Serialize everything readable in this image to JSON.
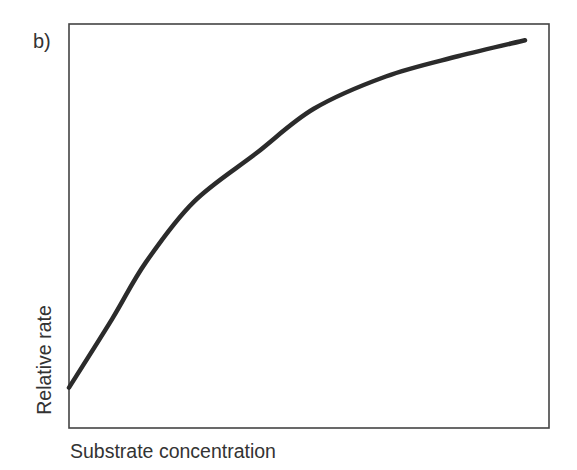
{
  "chart_data": {
    "type": "line",
    "panel_label": "b)",
    "title": "",
    "xlabel": "Substrate concentration",
    "ylabel": "Relative rate",
    "grid": false,
    "ticks": false,
    "legend": null,
    "xlim": [
      0,
      1
    ],
    "ylim": [
      0,
      1
    ],
    "series": [
      {
        "name": "rate curve",
        "description": "saturating (hyperbolic) increase of relative rate with substrate concentration",
        "x": [
          0.0,
          0.09,
          0.16,
          0.26,
          0.39,
          0.51,
          0.66,
          0.81,
          0.95
        ],
        "y": [
          0.1,
          0.27,
          0.41,
          0.56,
          0.68,
          0.79,
          0.87,
          0.92,
          0.96
        ]
      }
    ],
    "colors": {
      "line": "#2b2b2b",
      "frame": "#444444",
      "background": "#ffffff"
    }
  },
  "frame": {
    "left": 69,
    "top": 24,
    "right": 549,
    "bottom": 428
  }
}
